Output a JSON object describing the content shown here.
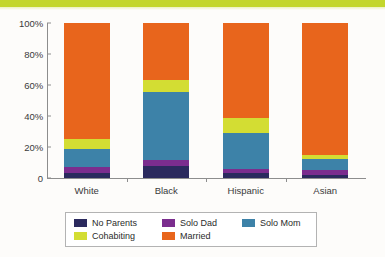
{
  "chart_data": {
    "type": "bar",
    "subtype": "stacked-100-percent",
    "title": "",
    "subtitle": "",
    "xlabel": "",
    "ylabel": "",
    "categories": [
      "White",
      "Black",
      "Hispanic",
      "Asian"
    ],
    "ylim": [
      0,
      100
    ],
    "ytick_labels": [
      "0",
      "20%",
      "40%",
      "60%",
      "80%",
      "100%"
    ],
    "ytick_values": [
      0,
      20,
      40,
      60,
      80,
      100
    ],
    "grid": false,
    "legend_position": "bottom",
    "legend_entries": [
      "No Parents",
      "Solo Dad",
      "Solo Mom",
      "Cohabiting",
      "Married"
    ],
    "series": [
      {
        "name": "No Parents",
        "color": "#2b2a5e",
        "values": [
          3,
          8,
          3,
          2
        ]
      },
      {
        "name": "Solo Dad",
        "color": "#7b2d8e",
        "values": [
          4,
          3.5,
          3,
          3
        ]
      },
      {
        "name": "Solo Mom",
        "color": "#3d82a8",
        "values": [
          11.5,
          44,
          23,
          7.5
        ]
      },
      {
        "name": "Cohabiting",
        "color": "#d3dd33",
        "values": [
          7,
          8,
          10,
          2.5
        ]
      },
      {
        "name": "Married",
        "color": "#e8651c",
        "values": [
          74.5,
          36.5,
          61,
          85
        ]
      }
    ]
  },
  "decor": {
    "top_band_color": "#c3d62b"
  },
  "axis": {
    "line_color": "#8d8d8d"
  }
}
